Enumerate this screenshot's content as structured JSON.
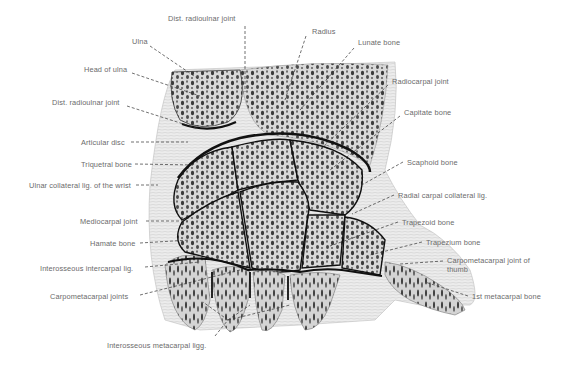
{
  "diagram": {
    "labels": [
      {
        "id": "dist-radioulnar-top",
        "text": "Dist. radioulnar joint",
        "x": 168,
        "y": 19
      },
      {
        "id": "ulna",
        "text": "Ulna",
        "x": 132,
        "y": 41
      },
      {
        "id": "radius",
        "text": "Radius",
        "x": 312,
        "y": 31
      },
      {
        "id": "lunate",
        "text": "Lunate bone",
        "x": 358,
        "y": 42
      },
      {
        "id": "head-of-ulna",
        "text": "Head of ulna",
        "x": 84,
        "y": 69
      },
      {
        "id": "radiocarpal",
        "text": "Radiocarpal joint",
        "x": 392,
        "y": 81
      },
      {
        "id": "dist-radioulnar-left",
        "text": "Dist. radioulnar joint",
        "x": 52,
        "y": 102
      },
      {
        "id": "capitate",
        "text": "Capitate bone",
        "x": 404,
        "y": 112
      },
      {
        "id": "articular-disc",
        "text": "Articular disc",
        "x": 81,
        "y": 138
      },
      {
        "id": "triquetral",
        "text": "Triquetral bone",
        "x": 81,
        "y": 161
      },
      {
        "id": "scaphoid",
        "text": "Scaphoid bone",
        "x": 407,
        "y": 158
      },
      {
        "id": "ulnar-collateral",
        "text": "Ulnar collateral lig. of the wrist",
        "x": 29,
        "y": 181
      },
      {
        "id": "radial-carpal-collateral",
        "text": "Radial carpal collateral lig.",
        "x": 398,
        "y": 191
      },
      {
        "id": "mediocarpal",
        "text": "Mediocarpal joint",
        "x": 80,
        "y": 217
      },
      {
        "id": "trapezoid",
        "text": "Trapezoid bone",
        "x": 402,
        "y": 218
      },
      {
        "id": "hamate",
        "text": "Hamate bone",
        "x": 90,
        "y": 239
      },
      {
        "id": "trapezium",
        "text": "Trapezium bone",
        "x": 426,
        "y": 238
      },
      {
        "id": "cmc-thumb",
        "text": "Carpometacarpal joint of thumb",
        "x": 447,
        "y": 257
      },
      {
        "id": "interosseous-intercarpal",
        "text": "Interosseous intercarpal lig.",
        "x": 40,
        "y": 264
      },
      {
        "id": "carpometacarpal-joints",
        "text": "Carpometacarpal joints",
        "x": 50,
        "y": 292
      },
      {
        "id": "first-metacarpal",
        "text": "1st metacarpal bone",
        "x": 472,
        "y": 292
      },
      {
        "id": "interosseous-metacarpal",
        "text": "Interosseous metacarpal ligg.",
        "x": 107,
        "y": 342
      }
    ]
  }
}
